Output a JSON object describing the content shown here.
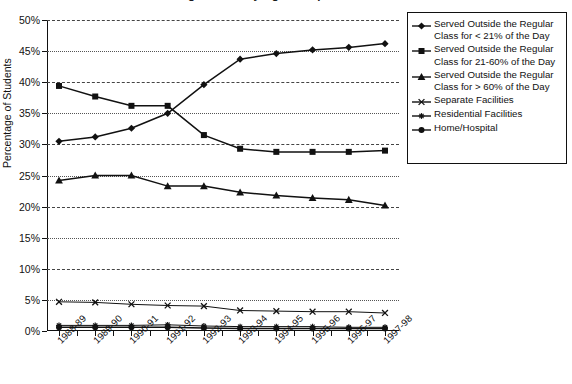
{
  "chart_data": {
    "type": "line",
    "title": "Students Age 6 to 21 by Age Group",
    "xlabel": "",
    "ylabel": "Percentage of Students",
    "ylim": [
      0,
      50
    ],
    "ytick_labels": [
      "0%",
      "5%",
      "10%",
      "15%",
      "20%",
      "25%",
      "30%",
      "35%",
      "40%",
      "45%",
      "50%"
    ],
    "ytick_values": [
      0,
      5,
      10,
      15,
      20,
      25,
      30,
      35,
      40,
      45,
      50
    ],
    "grid": true,
    "legend_position": "right",
    "categories": [
      "1988-89",
      "1989-90",
      "1990-91",
      "1991-92",
      "1992-93",
      "1993-94",
      "1994-95",
      "1995-96",
      "1996-97",
      "1997-98"
    ],
    "series": [
      {
        "name": "Served Outside the Regular Class for < 21% of the Day",
        "marker": "diamond",
        "values": [
          30.5,
          31.2,
          32.6,
          35.0,
          39.6,
          43.7,
          44.6,
          45.2,
          45.6,
          46.2
        ]
      },
      {
        "name": "Served Outside the Regular Class for 21-60% of the Day",
        "marker": "square",
        "values": [
          39.4,
          37.7,
          36.2,
          36.2,
          31.5,
          29.3,
          28.8,
          28.8,
          28.8,
          29.0
        ]
      },
      {
        "name": "Served Outside the Regular Class for > 60% of the Day",
        "marker": "triangle",
        "values": [
          24.2,
          25.0,
          25.0,
          23.3,
          23.3,
          22.3,
          21.8,
          21.4,
          21.1,
          20.2
        ]
      },
      {
        "name": "Separate Facilities",
        "marker": "cross",
        "values": [
          4.7,
          4.6,
          4.3,
          4.1,
          4.0,
          3.3,
          3.2,
          3.1,
          3.1,
          2.9
        ]
      },
      {
        "name": "Residential Facilities",
        "marker": "asterisk",
        "values": [
          0.9,
          0.9,
          0.9,
          1.0,
          0.8,
          0.7,
          0.7,
          0.7,
          0.6,
          0.6
        ]
      },
      {
        "name": "Home/Hospital",
        "marker": "circle",
        "values": [
          0.6,
          0.6,
          0.6,
          0.6,
          0.5,
          0.4,
          0.4,
          0.4,
          0.4,
          0.4
        ]
      }
    ]
  },
  "legend": {
    "items": [
      {
        "label_line1": "Served Outside the Regular",
        "label_line2": "Class for < 21% of the Day",
        "marker": "diamond"
      },
      {
        "label_line1": "Served Outside the Regular",
        "label_line2": "Class for 21-60% of the Day",
        "marker": "square"
      },
      {
        "label_line1": "Served Outside the Regular",
        "label_line2": "Class for > 60% of the Day",
        "marker": "triangle"
      },
      {
        "label_line1": "Separate Facilities",
        "label_line2": "",
        "marker": "cross"
      },
      {
        "label_line1": "Residential Facilities",
        "label_line2": "",
        "marker": "asterisk"
      },
      {
        "label_line1": "Home/Hospital",
        "label_line2": "",
        "marker": "circle"
      }
    ]
  }
}
